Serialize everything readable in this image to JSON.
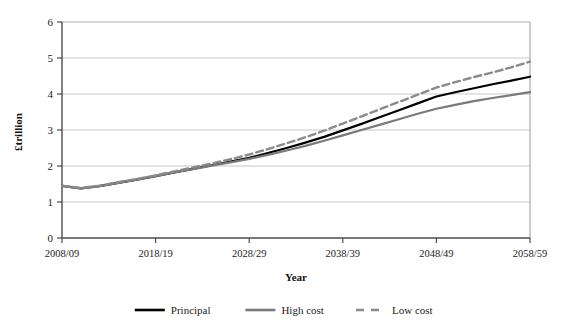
{
  "chart_data": {
    "type": "line",
    "title": "",
    "xlabel": "Year",
    "ylabel": "£trillion",
    "ylim": [
      0,
      6
    ],
    "yticks": [
      0,
      1,
      2,
      3,
      4,
      5,
      6
    ],
    "ytick_labels": [
      "0",
      "1",
      "2",
      "3",
      "4",
      "5",
      "6"
    ],
    "grid": "horizontal",
    "legend_position": "bottom",
    "categories": [
      "2008/09",
      "2010/11",
      "2012/13",
      "2014/15",
      "2016/17",
      "2018/19",
      "2020/21",
      "2022/23",
      "2024/25",
      "2026/27",
      "2028/29",
      "2030/31",
      "2032/33",
      "2034/35",
      "2036/37",
      "2038/39",
      "2040/41",
      "2042/43",
      "2044/45",
      "2046/47",
      "2048/49",
      "2050/51",
      "2052/53",
      "2054/55",
      "2056/57",
      "2058/59"
    ],
    "xtick_labels": [
      "2008/09",
      "2018/19",
      "2028/29",
      "2038/39",
      "2048/49",
      "2058/59"
    ],
    "series": [
      {
        "name": "Principal",
        "color": "#000000",
        "style": "solid",
        "width": 2.2,
        "values": [
          1.45,
          1.38,
          1.44,
          1.53,
          1.62,
          1.72,
          1.82,
          1.92,
          2.02,
          2.12,
          2.23,
          2.36,
          2.5,
          2.65,
          2.81,
          2.99,
          3.17,
          3.36,
          3.55,
          3.74,
          3.93,
          4.05,
          4.16,
          4.27,
          4.37,
          4.48
        ]
      },
      {
        "name": "High cost",
        "color": "#7a7a7a",
        "style": "solid",
        "width": 2.2,
        "values": [
          1.45,
          1.38,
          1.44,
          1.53,
          1.62,
          1.72,
          1.82,
          1.91,
          2.01,
          2.1,
          2.2,
          2.31,
          2.43,
          2.56,
          2.7,
          2.85,
          3.0,
          3.15,
          3.3,
          3.45,
          3.59,
          3.7,
          3.8,
          3.89,
          3.97,
          4.05
        ]
      },
      {
        "name": "Low cost",
        "color": "#8a8a8a",
        "style": "dashed",
        "width": 2.4,
        "values": [
          1.45,
          1.39,
          1.45,
          1.55,
          1.64,
          1.74,
          1.85,
          1.96,
          2.07,
          2.19,
          2.32,
          2.47,
          2.63,
          2.8,
          2.98,
          3.18,
          3.38,
          3.58,
          3.78,
          3.98,
          4.18,
          4.33,
          4.47,
          4.6,
          4.74,
          4.9
        ]
      }
    ],
    "legend": [
      {
        "label": "Principal",
        "color": "#000000",
        "style": "solid"
      },
      {
        "label": "High cost",
        "color": "#7a7a7a",
        "style": "solid"
      },
      {
        "label": "Low cost",
        "color": "#8a8a8a",
        "style": "dashed"
      }
    ],
    "colors": {
      "axis": "#4d4d4d",
      "grid": "#c9c9c9",
      "background": "#ffffff",
      "text": "#222222"
    }
  }
}
